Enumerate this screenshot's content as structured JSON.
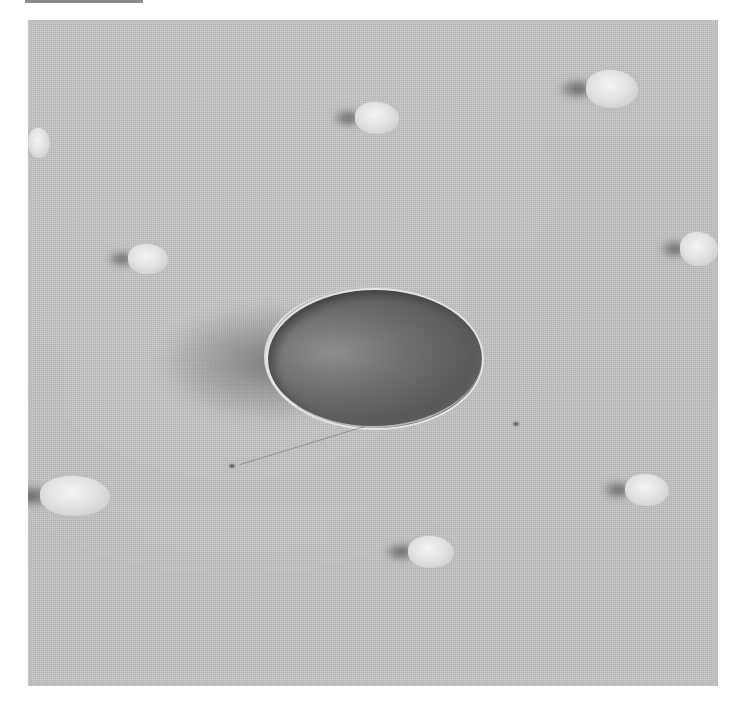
{
  "image": {
    "kind": "grayscale micrograph",
    "colors": {
      "page_background": "#ffffff",
      "substrate": "#c4c4c4",
      "dish_center": "#6f6f6f",
      "dish_rim": "#e4e4e4",
      "particle": "#e8e8e8",
      "shadow": "#505050"
    },
    "dish": {
      "cx": 345,
      "cy": 337,
      "rx": 107,
      "ry": 69
    },
    "particles": [
      {
        "x": 355,
        "y": 102,
        "w": 44,
        "h": 32
      },
      {
        "x": 586,
        "y": 70,
        "w": 52,
        "h": 38
      },
      {
        "x": 28,
        "y": 128,
        "w": 22,
        "h": 30
      },
      {
        "x": 128,
        "y": 244,
        "w": 40,
        "h": 30
      },
      {
        "x": 680,
        "y": 232,
        "w": 38,
        "h": 34
      },
      {
        "x": 40,
        "y": 476,
        "w": 70,
        "h": 40
      },
      {
        "x": 625,
        "y": 474,
        "w": 44,
        "h": 32
      },
      {
        "x": 408,
        "y": 536,
        "w": 46,
        "h": 32
      }
    ],
    "specks": [
      {
        "x": 228,
        "y": 463
      },
      {
        "x": 512,
        "y": 421
      }
    ]
  }
}
